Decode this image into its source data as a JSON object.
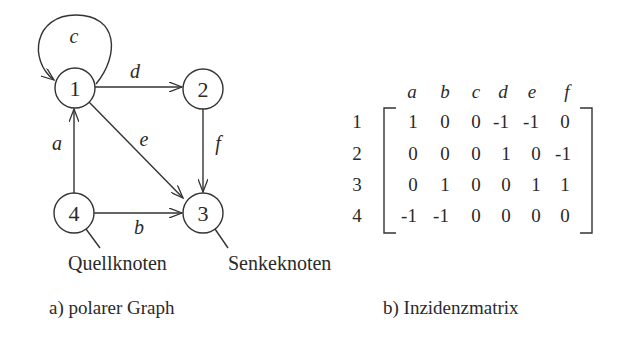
{
  "graph": {
    "title": "a) polarer Graph",
    "nodes": [
      {
        "id": "1",
        "label": "1"
      },
      {
        "id": "2",
        "label": "2"
      },
      {
        "id": "3",
        "label": "3"
      },
      {
        "id": "4",
        "label": "4"
      }
    ],
    "edges": [
      {
        "label": "a",
        "from": "4",
        "to": "1"
      },
      {
        "label": "b",
        "from": "4",
        "to": "3"
      },
      {
        "label": "c",
        "from": "1",
        "to": "1"
      },
      {
        "label": "d",
        "from": "1",
        "to": "2"
      },
      {
        "label": "e",
        "from": "1",
        "to": "3"
      },
      {
        "label": "f",
        "from": "2",
        "to": "3"
      }
    ],
    "annotations": {
      "source": "Quellknoten",
      "sink": "Senkeknoten"
    }
  },
  "matrix": {
    "title": "b) Inzidenzmatrix",
    "columns": [
      "a",
      "b",
      "c",
      "d",
      "e",
      "f"
    ],
    "rows": [
      {
        "label": "1",
        "values": [
          "1",
          "0",
          "0",
          "-1",
          "-1",
          "0"
        ]
      },
      {
        "label": "2",
        "values": [
          "0",
          "0",
          "0",
          "1",
          "0",
          "-1"
        ]
      },
      {
        "label": "3",
        "values": [
          "0",
          "1",
          "0",
          "0",
          "1",
          "1"
        ]
      },
      {
        "label": "4",
        "values": [
          "-1",
          "-1",
          "0",
          "0",
          "0",
          "0"
        ]
      }
    ]
  }
}
